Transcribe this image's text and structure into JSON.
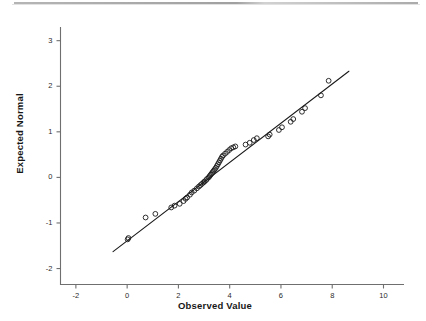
{
  "figure": {
    "kind": "normal-q-q-plot",
    "background_color": "#ffffff",
    "foreground_color": "#1a1a1a",
    "scan_artifact_top_rule": true
  },
  "chart_data": {
    "type": "scatter",
    "title": "",
    "subtitle": "",
    "xlabel": "Observed Value",
    "ylabel": "Expected Normal",
    "xlim": [
      -2.6,
      10.8
    ],
    "ylim": [
      -2.35,
      3.3
    ],
    "xticks": [
      -2,
      0,
      2,
      4,
      6,
      8,
      10
    ],
    "xtick_labels": [
      "-2",
      "0",
      "2",
      "4",
      "6",
      "8",
      "10"
    ],
    "yticks": [
      -2,
      -1,
      0,
      1,
      2,
      3
    ],
    "ytick_labels": [
      "-2",
      "-1",
      "0",
      "1",
      "2",
      "3"
    ],
    "grid": false,
    "legend": null,
    "marker": {
      "shape": "open-circle",
      "radius_px": 2.4,
      "stroke": "#1a1a1a",
      "stroke_width": 0.9,
      "fill": "none"
    },
    "reference_line": {
      "label": "normal reference line",
      "stroke": "#1a1a1a",
      "stroke_width": 1.1,
      "x_start": -0.55,
      "y_start": -1.63,
      "x_end": 8.65,
      "y_end": 2.33
    },
    "series": [
      {
        "name": "Observed vs Expected Normal",
        "x": [
          0.02,
          0.05,
          0.72,
          1.1,
          1.72,
          1.85,
          2.05,
          2.2,
          2.28,
          2.34,
          2.45,
          2.52,
          2.62,
          2.72,
          2.8,
          2.86,
          2.92,
          2.98,
          3.02,
          3.08,
          3.12,
          3.18,
          3.22,
          3.26,
          3.3,
          3.34,
          3.38,
          3.42,
          3.46,
          3.5,
          3.54,
          3.58,
          3.62,
          3.66,
          3.7,
          3.74,
          3.82,
          3.9,
          3.98,
          4.06,
          4.14,
          4.22,
          4.62,
          4.78,
          4.94,
          5.06,
          5.5,
          5.56,
          5.92,
          6.04,
          6.38,
          6.48,
          6.82,
          6.94,
          7.56,
          7.86
        ],
        "y": [
          -1.36,
          -1.33,
          -0.88,
          -0.8,
          -0.66,
          -0.62,
          -0.58,
          -0.52,
          -0.47,
          -0.44,
          -0.38,
          -0.33,
          -0.29,
          -0.24,
          -0.2,
          -0.17,
          -0.14,
          -0.11,
          -0.09,
          -0.06,
          -0.03,
          0.0,
          0.03,
          0.06,
          0.09,
          0.12,
          0.15,
          0.18,
          0.21,
          0.25,
          0.29,
          0.33,
          0.37,
          0.41,
          0.45,
          0.48,
          0.52,
          0.56,
          0.6,
          0.64,
          0.66,
          0.68,
          0.72,
          0.76,
          0.82,
          0.86,
          0.9,
          0.94,
          1.04,
          1.1,
          1.22,
          1.28,
          1.44,
          1.52,
          1.8,
          2.12
        ]
      }
    ],
    "n_points": 56
  },
  "axis_titles": {
    "x": "Observed Value",
    "y": "Expected Normal"
  }
}
